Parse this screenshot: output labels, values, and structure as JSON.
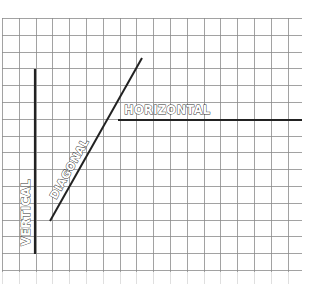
{
  "diagram": {
    "title": "",
    "grid": {
      "left": 2,
      "top": 18,
      "right": 302,
      "bottom": 272,
      "cell": 16.8,
      "color": "#8a8a8a",
      "background": "#ffffff"
    },
    "lines": [
      {
        "id": "vertical",
        "label": "VERTICAL",
        "x1": 35,
        "y1": 69,
        "x2": 35,
        "y2": 254,
        "color": "#222222",
        "width": 2.2
      },
      {
        "id": "diagonal",
        "label": "DIAGONAL",
        "x1": 50,
        "y1": 221,
        "x2": 142,
        "y2": 58,
        "color": "#222222",
        "width": 2
      },
      {
        "id": "horizontal",
        "label": "HORIZONTAL",
        "x1": 118,
        "y1": 120,
        "x2": 302,
        "y2": 120,
        "color": "#222222",
        "width": 2.2
      }
    ],
    "labels": {
      "vertical": "VERTICAL",
      "diagonal": "DIAGONAL",
      "horizontal": "HORIZONTAL"
    }
  }
}
